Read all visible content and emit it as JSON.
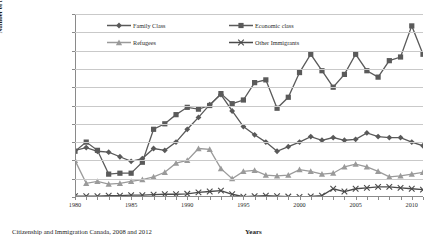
{
  "figure": {
    "source_note": "Citizenship and Immigration Canada, 2008 and 2012"
  },
  "chart_data": {
    "type": "line",
    "title": "",
    "xlabel": "Years",
    "ylabel": "Number of immigrants",
    "ylim": [
      0,
      200000
    ],
    "ytick_step": 20000,
    "ytick_labels": [
      "0",
      "20000",
      "40000",
      "60000",
      "80000",
      "100000",
      "120000",
      "140000",
      "160000",
      "180000",
      "200000"
    ],
    "xlim": [
      1980,
      2011
    ],
    "xtick_labels": [
      "1980",
      "1985",
      "1990",
      "1995",
      "2000",
      "2005",
      "2010"
    ],
    "xtick_values": [
      1980,
      1985,
      1990,
      1995,
      2000,
      2005,
      2010
    ],
    "grid": "horizontal",
    "legend_position": "top-left-inside",
    "x": [
      1980,
      1981,
      1982,
      1983,
      1984,
      1985,
      1986,
      1987,
      1988,
      1989,
      1990,
      1991,
      1992,
      1993,
      1994,
      1995,
      1996,
      1997,
      1998,
      1999,
      2000,
      2001,
      2002,
      2003,
      2004,
      2005,
      2006,
      2007,
      2008,
      2009,
      2010,
      2011
    ],
    "series": [
      {
        "name": "Family Class",
        "marker": "diamond",
        "color": "#595959",
        "values": [
          51000,
          54000,
          50000,
          49000,
          44000,
          39000,
          42000,
          53000,
          51000,
          60000,
          74000,
          87000,
          101000,
          112000,
          94000,
          77000,
          68000,
          60000,
          50000,
          55000,
          60000,
          66000,
          62000,
          65000,
          62000,
          63000,
          70000,
          66000,
          65000,
          65000,
          60000,
          56000
        ]
      },
      {
        "name": "Economic class",
        "marker": "square",
        "color": "#5a5a5a",
        "values": [
          50000,
          60000,
          51000,
          25000,
          26000,
          26000,
          38000,
          74000,
          80000,
          90000,
          98000,
          96000,
          100000,
          113000,
          102000,
          106000,
          125000,
          128000,
          97000,
          109000,
          136000,
          156000,
          138000,
          120000,
          134000,
          156000,
          138000,
          131000,
          149000,
          153000,
          187000,
          156000
        ]
      },
      {
        "name": "Refugees",
        "marker": "triangle",
        "color": "#9a9a9a",
        "values": [
          40000,
          15000,
          17000,
          14000,
          15000,
          17000,
          19000,
          22000,
          27000,
          37000,
          40000,
          53000,
          52000,
          31000,
          20000,
          28000,
          29000,
          24000,
          23000,
          24000,
          30000,
          28000,
          25000,
          26000,
          33000,
          36000,
          33000,
          28000,
          22000,
          23000,
          25000,
          27000
        ]
      },
      {
        "name": "Other Immigrants",
        "marker": "x",
        "color": "#4a4a4a",
        "values": [
          1000,
          1000,
          1000,
          1500,
          1500,
          2000,
          2000,
          2500,
          3000,
          3000,
          3500,
          5000,
          6000,
          7000,
          3000,
          300,
          1000,
          1500,
          1000,
          500,
          200,
          700,
          1500,
          9000,
          6000,
          9000,
          10000,
          11000,
          11000,
          10000,
          9000,
          8000
        ]
      }
    ]
  }
}
